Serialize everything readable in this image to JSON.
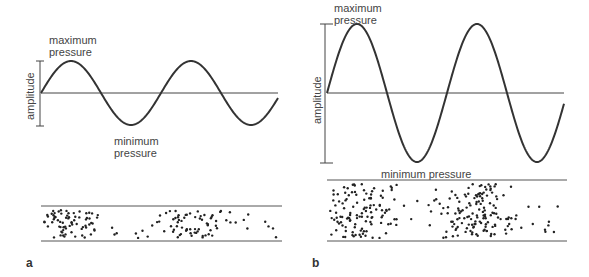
{
  "panels": [
    {
      "id": "a",
      "letter": "a",
      "max_label_1": "maximum",
      "max_label_2": "pressure",
      "min_label_1": "minimum",
      "min_label_2": "pressure",
      "amplitude_label": "amplitude",
      "wave": {
        "x0": 41,
        "x1": 278,
        "axis_y": 93,
        "amp": 32,
        "period": 120
      },
      "tube": {
        "x0": 41,
        "x1": 282,
        "y0": 206,
        "y1": 241
      }
    },
    {
      "id": "b",
      "letter": "b",
      "max_label_1": "maximum",
      "max_label_2": "pressure",
      "min_label": "minimum pressure",
      "amplitude_label": "amplitude",
      "wave": {
        "x0": 327,
        "x1": 564,
        "axis_y": 93,
        "amp": 69,
        "period": 120
      },
      "tube": {
        "x0": 327,
        "x1": 567,
        "y0": 180,
        "y1": 241
      }
    }
  ],
  "colors": {
    "line": "#333333",
    "dot": "#222222",
    "text": "#444444"
  }
}
